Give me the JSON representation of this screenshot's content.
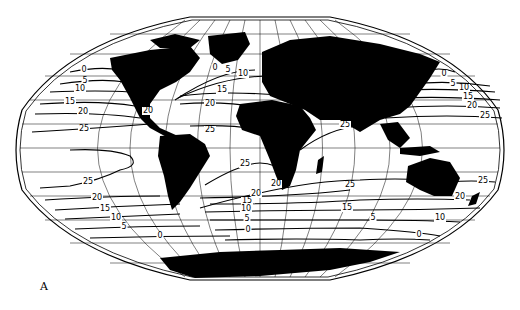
{
  "figure": {
    "panel_label": "A",
    "projection": "Winkel-style world map, oval",
    "colors": {
      "land": "#000000",
      "ocean": "#ffffff",
      "lines": "#000000"
    }
  },
  "isotherm_labels": [
    {
      "value": "0",
      "x": 84,
      "y": 72
    },
    {
      "value": "5",
      "x": 85,
      "y": 83
    },
    {
      "value": "10",
      "x": 80,
      "y": 91
    },
    {
      "value": "15",
      "x": 70,
      "y": 104
    },
    {
      "value": "20",
      "x": 83,
      "y": 114
    },
    {
      "value": "25",
      "x": 84,
      "y": 131
    },
    {
      "value": "0",
      "x": 215,
      "y": 70
    },
    {
      "value": "5",
      "x": 228,
      "y": 72
    },
    {
      "value": "10",
      "x": 243,
      "y": 76
    },
    {
      "value": "15",
      "x": 222,
      "y": 92
    },
    {
      "value": "20",
      "x": 148,
      "y": 113
    },
    {
      "value": "20",
      "x": 210,
      "y": 106
    },
    {
      "value": "25",
      "x": 210,
      "y": 132
    },
    {
      "value": "25",
      "x": 345,
      "y": 127
    },
    {
      "value": "0",
      "x": 444,
      "y": 76
    },
    {
      "value": "5",
      "x": 453,
      "y": 86
    },
    {
      "value": "10",
      "x": 464,
      "y": 90
    },
    {
      "value": "15",
      "x": 468,
      "y": 99
    },
    {
      "value": "20",
      "x": 472,
      "y": 108
    },
    {
      "value": "25",
      "x": 485,
      "y": 118
    },
    {
      "value": "25",
      "x": 245,
      "y": 166
    },
    {
      "value": "25",
      "x": 88,
      "y": 184
    },
    {
      "value": "20",
      "x": 97,
      "y": 200
    },
    {
      "value": "15",
      "x": 105,
      "y": 211
    },
    {
      "value": "10",
      "x": 116,
      "y": 220
    },
    {
      "value": "5",
      "x": 124,
      "y": 229
    },
    {
      "value": "0",
      "x": 160,
      "y": 238
    },
    {
      "value": "25",
      "x": 350,
      "y": 187
    },
    {
      "value": "20",
      "x": 256,
      "y": 196
    },
    {
      "value": "20",
      "x": 276,
      "y": 186
    },
    {
      "value": "15",
      "x": 247,
      "y": 203
    },
    {
      "value": "10",
      "x": 246,
      "y": 211
    },
    {
      "value": "5",
      "x": 247,
      "y": 221
    },
    {
      "value": "0",
      "x": 248,
      "y": 232
    },
    {
      "value": "15",
      "x": 347,
      "y": 210
    },
    {
      "value": "5",
      "x": 373,
      "y": 220
    },
    {
      "value": "25",
      "x": 483,
      "y": 183
    },
    {
      "value": "20",
      "x": 460,
      "y": 199
    },
    {
      "value": "10",
      "x": 440,
      "y": 220
    },
    {
      "value": "0",
      "x": 419,
      "y": 237
    }
  ]
}
